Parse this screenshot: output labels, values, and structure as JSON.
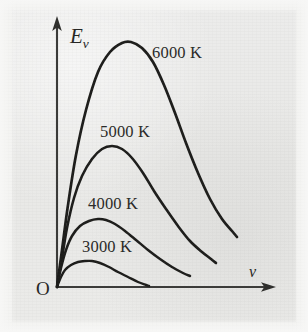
{
  "figure": {
    "background_color": "#eaeaea",
    "ink_color": "#1d1d1b"
  },
  "axes": {
    "y_label_main": "E",
    "y_label_sub": "ν",
    "x_label": "ν",
    "origin_label": "O",
    "y_axis_arrow": "up-arrow",
    "x_axis_arrow": "right-arrow"
  },
  "chart_data": {
    "type": "line",
    "title": "",
    "xlabel": "ν",
    "ylabel": "Eν",
    "grid": false,
    "legend_position": "inline-annotations",
    "xlim": [
      0,
      1
    ],
    "ylim": [
      0,
      1
    ],
    "axis_ticks": {
      "x": [],
      "y": []
    },
    "annotations": [
      {
        "text": "6000 K",
        "x": 0.44,
        "y": 0.86
      },
      {
        "text": "5000 K",
        "x": 0.24,
        "y": 0.53
      },
      {
        "text": "4000 K",
        "x": 0.2,
        "y": 0.29
      },
      {
        "text": "3000 K",
        "x": 0.17,
        "y": 0.13
      }
    ],
    "series": [
      {
        "name": "6000 K",
        "temperature_K": 6000,
        "peak_x": 0.335,
        "peak_y": 1.0,
        "end_x": 0.825,
        "points_px": [
          [
            57,
            287
          ],
          [
            62,
            250
          ],
          [
            68,
            205
          ],
          [
            76,
            155
          ],
          [
            86,
            110
          ],
          [
            98,
            72
          ],
          [
            110,
            52
          ],
          [
            122,
            43
          ],
          [
            131,
            42
          ],
          [
            142,
            48
          ],
          [
            153,
            62
          ],
          [
            164,
            85
          ],
          [
            175,
            113
          ],
          [
            186,
            143
          ],
          [
            198,
            173
          ],
          [
            210,
            199
          ],
          [
            222,
            219
          ],
          [
            232,
            231
          ],
          [
            237,
            237
          ]
        ]
      },
      {
        "name": "5000 K",
        "temperature_K": 5000,
        "peak_x": 0.275,
        "peak_y": 0.645,
        "end_x": 0.725,
        "points_px": [
          [
            57,
            287
          ],
          [
            62,
            258
          ],
          [
            67,
            228
          ],
          [
            74,
            198
          ],
          [
            82,
            176
          ],
          [
            92,
            159
          ],
          [
            102,
            149
          ],
          [
            112,
            146
          ],
          [
            122,
            149
          ],
          [
            132,
            158
          ],
          [
            143,
            173
          ],
          [
            154,
            191
          ],
          [
            166,
            209
          ],
          [
            178,
            226
          ],
          [
            190,
            241
          ],
          [
            202,
            252
          ],
          [
            211,
            259
          ],
          [
            216,
            263
          ]
        ]
      },
      {
        "name": "4000 K",
        "temperature_K": 4000,
        "peak_x": 0.235,
        "peak_y": 0.418,
        "end_x": 0.625,
        "points_px": [
          [
            57,
            287
          ],
          [
            61,
            268
          ],
          [
            66,
            250
          ],
          [
            72,
            236
          ],
          [
            80,
            226
          ],
          [
            89,
            221
          ],
          [
            98,
            219
          ],
          [
            106,
            220
          ],
          [
            115,
            224
          ],
          [
            125,
            231
          ],
          [
            136,
            240
          ],
          [
            148,
            250
          ],
          [
            160,
            259
          ],
          [
            172,
            267
          ],
          [
            183,
            273
          ],
          [
            190,
            276
          ]
        ]
      },
      {
        "name": "3000 K",
        "temperature_K": 3000,
        "peak_x": 0.16,
        "peak_y": 0.195,
        "end_x": 0.425,
        "points_px": [
          [
            57,
            287
          ],
          [
            61,
            277
          ],
          [
            65,
            270
          ],
          [
            71,
            265
          ],
          [
            78,
            262
          ],
          [
            85,
            261
          ],
          [
            92,
            261
          ],
          [
            100,
            263
          ],
          [
            109,
            267
          ],
          [
            118,
            272
          ],
          [
            128,
            277
          ],
          [
            138,
            282
          ],
          [
            146,
            285
          ],
          [
            149,
            286
          ]
        ]
      }
    ]
  }
}
